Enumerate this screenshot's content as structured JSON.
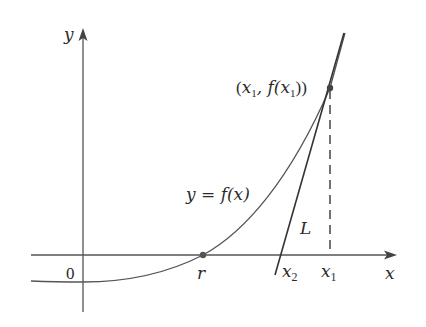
{
  "diagram": {
    "axes": {
      "x_label": "x",
      "y_label": "y",
      "origin_label": "0"
    },
    "curve": {
      "label_prefix": "y = ",
      "label_func": "f(x)"
    },
    "tangent": {
      "label": "L"
    },
    "points": {
      "root_label": "r",
      "x2_base": "x",
      "x2_sub": "2",
      "x1_base": "x",
      "x1_sub": "1",
      "point_label_open": "(",
      "point_label_x": "x",
      "point_label_sub1": "1",
      "point_label_mid": ", f(",
      "point_label_x2": "x",
      "point_label_sub2": "1",
      "point_label_close": "))"
    },
    "colors": {
      "axis": "#555555",
      "curve": "#555555",
      "tangent": "#333333",
      "dash": "#444444",
      "dot": "#444444"
    }
  }
}
